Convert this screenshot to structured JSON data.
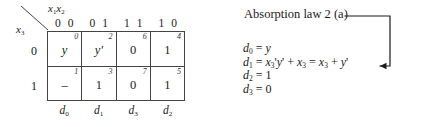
{
  "figure": {
    "kmap": {
      "corner": {
        "column_vars": "x1x2",
        "column_vars_base": "x",
        "row_var": "x3",
        "diagonal": "corner-diagonal-line"
      },
      "column_headers": [
        "0 0",
        "0 1",
        "1 1",
        "1 0"
      ],
      "row_labels": [
        "0",
        "1"
      ],
      "rows": [
        {
          "label": "0",
          "cells": [
            {
              "index": "0",
              "value": "y",
              "italic": true
            },
            {
              "index": "2",
              "value": "y'",
              "italic": true
            },
            {
              "index": "6",
              "value": "0",
              "italic": false
            },
            {
              "index": "4",
              "value": "1",
              "italic": false
            }
          ]
        },
        {
          "label": "1",
          "cells": [
            {
              "index": "1",
              "value": "–",
              "italic": false
            },
            {
              "index": "3",
              "value": "1",
              "italic": false
            },
            {
              "index": "7",
              "value": "0",
              "italic": false
            },
            {
              "index": "5",
              "value": "1",
              "italic": false
            }
          ]
        }
      ],
      "bottom_labels": [
        "d0",
        "d1",
        "d3",
        "d2"
      ]
    },
    "annotation": {
      "law_title": "Absorption law 2 (a)",
      "equations": [
        "d0 = y",
        "d1 = x3'y' + x3 = x3 + y'",
        "d2 = 1",
        "d3 = 0"
      ],
      "connector": "elbow-arrow-pointing-to-d1-equation"
    }
  },
  "colors": {
    "line": "#444444",
    "text": "#1a1a1a",
    "background": "#ffffff"
  }
}
